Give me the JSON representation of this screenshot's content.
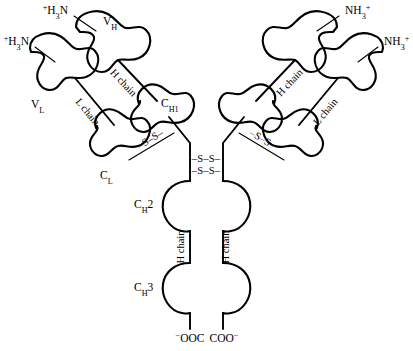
{
  "diagram": {
    "background_color": "#ffffff",
    "line_color": "#000000"
  },
  "termini": {
    "heavy_left_n": "⁺H₃N",
    "light_left_n": "⁺H₃N",
    "heavy_right_n": "NH₃⁺",
    "light_right_n": "NH₃⁺",
    "heavy_left_c": "⁻OOC",
    "heavy_right_c": "COO⁻"
  },
  "domains": {
    "v_h_left": "V",
    "v_h_left_sub": "H",
    "v_l_left": "V",
    "v_l_left_sub": "L",
    "c_h1_left": "C",
    "c_h1_left_sub": "H1",
    "c_l_left": "C",
    "c_l_left_sub": "L",
    "c_h2_left": "C",
    "c_h2_left_sub": "H",
    "c_h2_left_num": "2",
    "c_h3_left": "C",
    "c_h3_left_sub": "H",
    "c_h3_left_num": "3"
  },
  "chain_labels": {
    "h_chain_upper_left": "H chain",
    "l_chain_upper_left": "L chain",
    "h_chain_upper_right": "H chain",
    "l_chain_upper_right": "L chain",
    "h_chain_stem_left": "H chain",
    "h_chain_stem_right": "H chain"
  },
  "disulfides": {
    "interchain_left": "–S–S–",
    "interchain_right": "–S–S–",
    "hinge_upper": "–S–S–",
    "hinge_lower": "–S–S–"
  }
}
